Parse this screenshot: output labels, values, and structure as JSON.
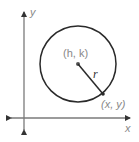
{
  "diagram": {
    "type": "circle-on-coordinate-plane",
    "axes": {
      "x_label": "x",
      "y_label": "y"
    },
    "center": {
      "label": "(h, k)"
    },
    "radius": {
      "label": "r"
    },
    "point_on_circle": {
      "label": "(x, y)"
    },
    "colors": {
      "axis": "#7a7a7a",
      "circle": "#2a2a2a",
      "label": "#888888"
    }
  }
}
